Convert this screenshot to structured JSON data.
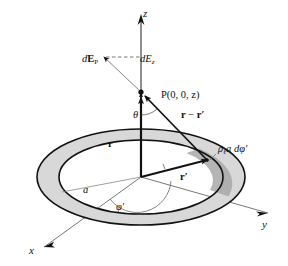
{
  "figure": {
    "background_color": "#ffffff",
    "line_color": "#111111",
    "ring_fill_color": "#d8d8d8",
    "ring_shadow_color": "#a8a8a8",
    "width": 288,
    "height": 266
  },
  "axes": {
    "z": {
      "label": "z"
    },
    "y": {
      "label": "y"
    },
    "x": {
      "label": "x"
    }
  },
  "labels": {
    "dE_P": {
      "d": "d",
      "E": "E",
      "sub": "P"
    },
    "dE_z": {
      "d": "d",
      "E": "E",
      "sub": "z"
    },
    "point_P": "P(0, 0, z)",
    "theta": "θ",
    "vector_r": "r",
    "vector_r_minus_rprime": {
      "r": "r",
      "minus": " − ",
      "rprime": "r′"
    },
    "charge_element": {
      "rho": "ρ",
      "sub": "ℓ",
      "rest": "a dφ′"
    },
    "radius_a": "a",
    "vector_rprime": "r′",
    "phi_prime": "φ′"
  },
  "geometry": {
    "origin": {
      "x": 141,
      "y": 177
    },
    "point_p": {
      "x": 141,
      "y": 92
    },
    "charge_point": {
      "x": 205,
      "y": 160
    },
    "ring_outer_rx": 104,
    "ring_outer_ry": 48,
    "ring_inner_rx": 82,
    "ring_inner_ry": 37,
    "ring_thickness": 9
  }
}
